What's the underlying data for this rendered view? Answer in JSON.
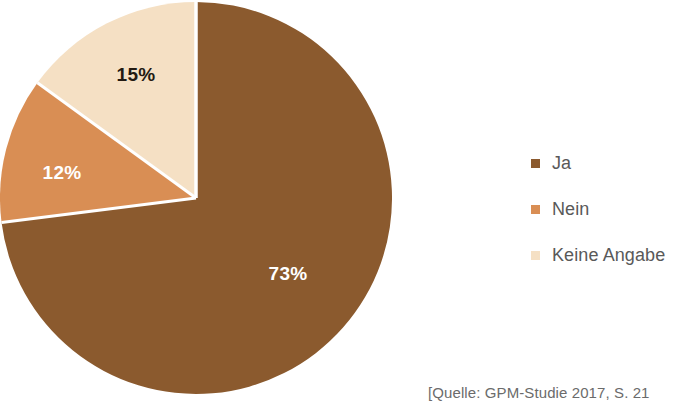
{
  "chart_data": {
    "type": "pie",
    "title": "",
    "subtitle": "",
    "labels": [
      "Ja",
      "Nein",
      "Keine Angabe"
    ],
    "values": [
      73,
      12,
      15
    ],
    "value_labels": [
      "73%",
      "12%",
      "15%"
    ],
    "colors": [
      "#8b5a2e",
      "#d98e54",
      "#f5e0c4"
    ],
    "label_text_colors": [
      "#ffffff",
      "#ffffff",
      "#231a12"
    ],
    "units": "percent",
    "start_angle_deg": 0,
    "direction": "clockwise",
    "legend_position": "right",
    "grid": false,
    "annotations": [
      "[Quelle: GPM-Studie 2017, S. 21"
    ]
  },
  "legend": {
    "items": [
      {
        "label": "Ja",
        "color": "#8b5a2e"
      },
      {
        "label": "Nein",
        "color": "#d98e54"
      },
      {
        "label": "Keine Angabe",
        "color": "#f5e0c4"
      }
    ]
  },
  "slice_labels": [
    {
      "text": "73%",
      "x": 288,
      "y": 274,
      "color": "#ffffff"
    },
    {
      "text": "12%",
      "x": 62,
      "y": 173,
      "color": "#ffffff"
    },
    {
      "text": "15%",
      "x": 136,
      "y": 75,
      "color": "#231a12"
    }
  ],
  "source": {
    "text": "[Quelle: GPM-Studie 2017, S. 21"
  },
  "geometry": {
    "center_x": 196,
    "center_y": 198,
    "radius": 196,
    "separator_color": "#ffffff",
    "separator_width": 3
  }
}
